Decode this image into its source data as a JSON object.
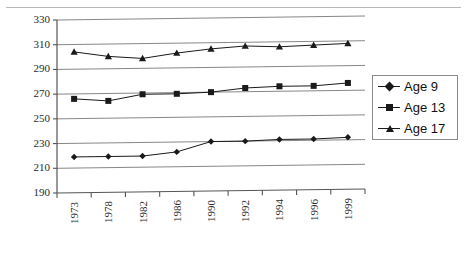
{
  "chart_data": {
    "type": "line",
    "title": "",
    "xlabel": "",
    "ylabel": "",
    "categories": [
      "1973",
      "1978",
      "1982",
      "1986",
      "1990",
      "1992",
      "1994",
      "1996",
      "1999"
    ],
    "ylim": [
      190,
      330
    ],
    "ytick_step": 20,
    "yticks": [
      330,
      310,
      290,
      270,
      250,
      230,
      210,
      190
    ],
    "grid": "horizontal",
    "legend_position": "right",
    "series": [
      {
        "name": "Age 9",
        "marker": "diamond",
        "values": [
          219,
          219,
          219,
          222,
          230,
          230,
          231,
          231,
          232
        ]
      },
      {
        "name": "Age 13",
        "marker": "square",
        "values": [
          266,
          264,
          269,
          269,
          270,
          273,
          274,
          274,
          276
        ]
      },
      {
        "name": "Age 17",
        "marker": "triangle",
        "values": [
          304,
          300,
          298,
          302,
          305,
          307,
          306,
          307,
          308
        ]
      }
    ]
  },
  "legend": {
    "items": [
      {
        "label": "Age 9",
        "marker": "diamond"
      },
      {
        "label": "Age 13",
        "marker": "square"
      },
      {
        "label": "Age 17",
        "marker": "triangle"
      }
    ]
  },
  "axes": {
    "y_labels": [
      "330",
      "310",
      "290",
      "270",
      "250",
      "230",
      "210",
      "190"
    ],
    "x_labels": [
      "1973",
      "1978",
      "1982",
      "1986",
      "1990",
      "1992",
      "1994",
      "1996",
      "1999"
    ]
  },
  "colors": {
    "line": "#1a1a1a",
    "grid": "#888888",
    "axis": "#555555",
    "background": "#ffffff",
    "legend_border": "#8a8a8a"
  }
}
